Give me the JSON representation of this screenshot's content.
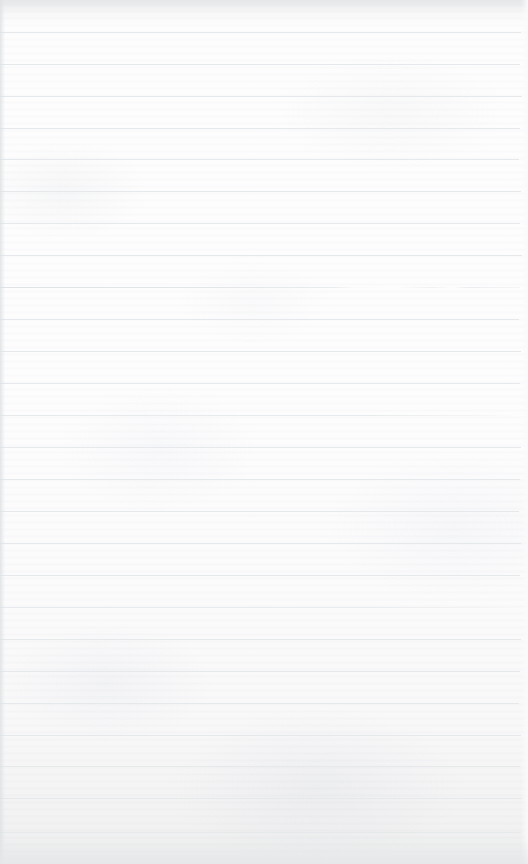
{
  "page": {
    "kind": "lined-notebook-page",
    "width": 528,
    "height": 864,
    "text_content": "",
    "handwriting_present": false,
    "printed_text_present": false
  },
  "paper": {
    "background_color": "#fcfcfd",
    "edge_shadow_color": "#e3e5e7",
    "bottom_tint_color": "#eceded",
    "texture": "faint horizontal grain with mottled fiber"
  },
  "ruling": {
    "line_color": "#e6e9eb",
    "line_thickness_px": 1,
    "spacing_px": 32,
    "first_line_y": 32,
    "left_inset_px": 0,
    "right_end_px": 520,
    "count": 26,
    "lines": [
      {
        "y": 32,
        "style": "normal",
        "right_end": 521
      },
      {
        "y": 64,
        "style": "normal",
        "right_end": 520
      },
      {
        "y": 96,
        "style": "normal",
        "right_end": 522
      },
      {
        "y": 128,
        "style": "normal",
        "right_end": 520
      },
      {
        "y": 159,
        "style": "normal",
        "right_end": 519
      },
      {
        "y": 191,
        "style": "normal",
        "right_end": 521
      },
      {
        "y": 223,
        "style": "normal",
        "right_end": 520
      },
      {
        "y": 255,
        "style": "normal",
        "right_end": 522
      },
      {
        "y": 287,
        "style": "broken",
        "right_end": 520
      },
      {
        "y": 319,
        "style": "normal",
        "right_end": 519
      },
      {
        "y": 351,
        "style": "normal",
        "right_end": 521
      },
      {
        "y": 383,
        "style": "normal",
        "right_end": 520
      },
      {
        "y": 415,
        "style": "faint",
        "right_end": 518
      },
      {
        "y": 447,
        "style": "normal",
        "right_end": 521
      },
      {
        "y": 479,
        "style": "normal",
        "right_end": 520
      },
      {
        "y": 511,
        "style": "normal",
        "right_end": 519
      },
      {
        "y": 543,
        "style": "normal",
        "right_end": 521
      },
      {
        "y": 575,
        "style": "normal",
        "right_end": 520
      },
      {
        "y": 607,
        "style": "faint",
        "right_end": 518
      },
      {
        "y": 639,
        "style": "normal",
        "right_end": 521
      },
      {
        "y": 671,
        "style": "normal",
        "right_end": 520
      },
      {
        "y": 703,
        "style": "normal",
        "right_end": 519
      },
      {
        "y": 735,
        "style": "normal",
        "right_end": 521
      },
      {
        "y": 766,
        "style": "normal",
        "right_end": 520
      },
      {
        "y": 798,
        "style": "normal",
        "right_end": 522
      },
      {
        "y": 832,
        "style": "normal",
        "right_end": 521
      }
    ]
  }
}
